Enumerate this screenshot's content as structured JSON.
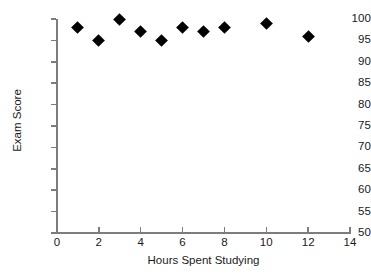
{
  "chart_data": {
    "type": "scatter",
    "title": "",
    "xlabel": "Hours Spent Studying",
    "ylabel": "Exam Score",
    "xlim": [
      0,
      14
    ],
    "ylim": [
      50,
      100
    ],
    "grid": false,
    "legend": null,
    "marker": {
      "shape": "diamond",
      "color": "#000000",
      "size_px": 9
    },
    "axis_color": "#7d7d7d",
    "xticks": [
      0,
      2,
      4,
      6,
      8,
      10,
      12,
      14
    ],
    "xtick_labels": [
      "0",
      "2",
      "4",
      "6",
      "8",
      "10",
      "12",
      "14"
    ],
    "yticks": [
      50,
      55,
      60,
      65,
      70,
      75,
      80,
      85,
      90,
      95,
      100
    ],
    "ytick_labels": [
      "50",
      "55",
      "60",
      "65",
      "70",
      "75",
      "80",
      "85",
      "90",
      "95",
      "100"
    ],
    "series": [
      {
        "name": "Exam Score vs Hours Studied",
        "points": [
          {
            "x": 1,
            "y": 98
          },
          {
            "x": 2,
            "y": 95
          },
          {
            "x": 3,
            "y": 100
          },
          {
            "x": 4,
            "y": 97
          },
          {
            "x": 5,
            "y": 95
          },
          {
            "x": 6,
            "y": 98
          },
          {
            "x": 7,
            "y": 97
          },
          {
            "x": 8,
            "y": 98
          },
          {
            "x": 10,
            "y": 99
          },
          {
            "x": 12,
            "y": 96
          }
        ]
      }
    ]
  }
}
